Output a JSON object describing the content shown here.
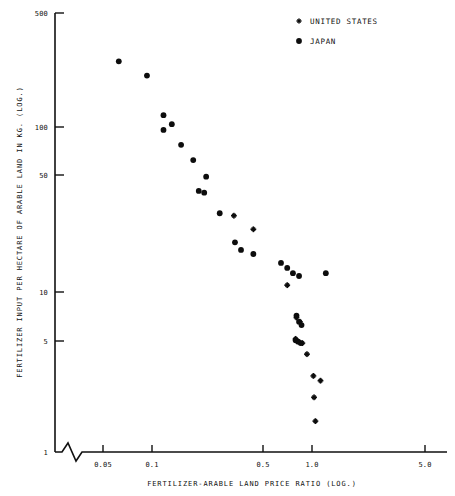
{
  "chart_data": {
    "type": "scatter",
    "title": "",
    "xlabel": "FERTILIZER-ARABLE LAND PRICE RATIO (LOG.)",
    "ylabel": "FERTILIZER INPUT PER HECTARE OF ARABLE LAND IN KG. (LOG.)",
    "xscale": "log",
    "yscale": "log",
    "xlim": [
      0.04,
      6.0
    ],
    "ylim": [
      1,
      500
    ],
    "grid": false,
    "xticks": [
      {
        "value": 0.05,
        "label": "0.05"
      },
      {
        "value": 0.1,
        "label": "0.1"
      },
      {
        "value": 0.5,
        "label": "0.5"
      },
      {
        "value": 1.0,
        "label": "1.0"
      },
      {
        "value": 5.0,
        "label": "5.0"
      }
    ],
    "yticks": [
      {
        "value": 500,
        "label": "500"
      },
      {
        "value": 100,
        "label": "100"
      },
      {
        "value": 50,
        "label": "50"
      },
      {
        "value": 10,
        "label": "10"
      },
      {
        "value": 5,
        "label": "5"
      },
      {
        "value": 1,
        "label": "1"
      }
    ],
    "axis_break": {
      "present": true,
      "axis": "x",
      "note": "zigzag break near origin"
    },
    "legend": {
      "position": "top-right",
      "entries": [
        {
          "name": "UNITED STATES",
          "marker": "star"
        },
        {
          "name": "JAPAN",
          "marker": "circle"
        }
      ]
    },
    "series": [
      {
        "name": "JAPAN",
        "marker": "circle",
        "points": [
          {
            "x": 0.062,
            "y": 250
          },
          {
            "x": 0.093,
            "y": 205
          },
          {
            "x": 0.118,
            "y": 118
          },
          {
            "x": 0.133,
            "y": 104
          },
          {
            "x": 0.118,
            "y": 96
          },
          {
            "x": 0.152,
            "y": 78
          },
          {
            "x": 0.181,
            "y": 63
          },
          {
            "x": 0.218,
            "y": 50
          },
          {
            "x": 0.196,
            "y": 41
          },
          {
            "x": 0.212,
            "y": 40
          },
          {
            "x": 0.265,
            "y": 30
          },
          {
            "x": 0.33,
            "y": 20
          },
          {
            "x": 0.36,
            "y": 18
          },
          {
            "x": 0.43,
            "y": 17
          },
          {
            "x": 0.64,
            "y": 15
          },
          {
            "x": 0.7,
            "y": 14
          },
          {
            "x": 0.76,
            "y": 13
          },
          {
            "x": 0.83,
            "y": 12.5
          },
          {
            "x": 1.22,
            "y": 13
          },
          {
            "x": 0.8,
            "y": 7.2
          },
          {
            "x": 0.83,
            "y": 6.6
          },
          {
            "x": 0.86,
            "y": 6.3
          },
          {
            "x": 0.79,
            "y": 5.1
          },
          {
            "x": 0.82,
            "y": 5.0
          },
          {
            "x": 0.85,
            "y": 4.9
          }
        ]
      },
      {
        "name": "UNITED STATES",
        "marker": "star",
        "points": [
          {
            "x": 0.325,
            "y": 29
          },
          {
            "x": 0.43,
            "y": 24
          },
          {
            "x": 0.7,
            "y": 11
          },
          {
            "x": 0.8,
            "y": 7.0
          },
          {
            "x": 0.84,
            "y": 6.6
          },
          {
            "x": 0.79,
            "y": 5.2
          },
          {
            "x": 0.87,
            "y": 4.9
          },
          {
            "x": 0.93,
            "y": 4.2
          },
          {
            "x": 1.02,
            "y": 3.1
          },
          {
            "x": 1.13,
            "y": 2.9
          },
          {
            "x": 1.03,
            "y": 2.3
          },
          {
            "x": 1.05,
            "y": 1.65
          }
        ]
      }
    ]
  }
}
